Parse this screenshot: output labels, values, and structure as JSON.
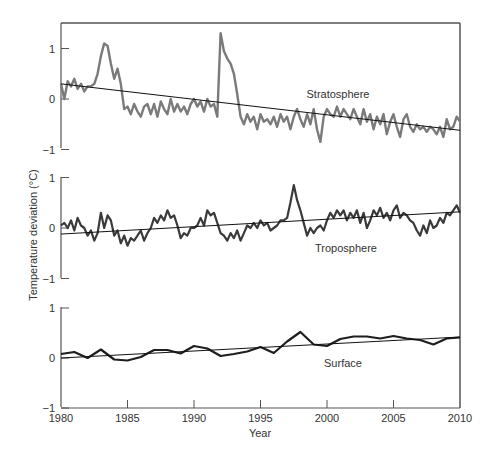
{
  "chart_data": {
    "type": "line",
    "title": "",
    "xlabel": "Year",
    "ylabel": "Temperature deviation (°C)",
    "x_range": [
      1980,
      2010
    ],
    "x_ticks": [
      1980,
      1985,
      1990,
      1995,
      2000,
      2005,
      2010
    ],
    "grid": false,
    "legend": "none (panels labeled inline)",
    "panels": [
      {
        "name": "Stratosphere",
        "label": "Stratosphere",
        "ylim": [
          -1,
          1
        ],
        "y_ticks": [
          -1,
          0,
          1
        ],
        "line_color": "#7a7a7a",
        "trend": {
          "start": [
            1980,
            0.3
          ],
          "end": [
            2010,
            -0.62
          ]
        },
        "x": [
          1980.0,
          1980.25,
          1980.5,
          1980.75,
          1981.0,
          1981.25,
          1981.5,
          1981.75,
          1982.0,
          1982.25,
          1982.5,
          1982.75,
          1983.0,
          1983.25,
          1983.5,
          1983.75,
          1984.0,
          1984.25,
          1984.5,
          1984.75,
          1985.0,
          1985.25,
          1985.5,
          1985.75,
          1986.0,
          1986.25,
          1986.5,
          1986.75,
          1987.0,
          1987.25,
          1987.5,
          1987.75,
          1988.0,
          1988.25,
          1988.5,
          1988.75,
          1989.0,
          1989.25,
          1989.5,
          1989.75,
          1990.0,
          1990.25,
          1990.5,
          1990.75,
          1991.0,
          1991.25,
          1991.5,
          1991.75,
          1992.0,
          1992.25,
          1992.5,
          1992.75,
          1993.0,
          1993.25,
          1993.5,
          1993.75,
          1994.0,
          1994.25,
          1994.5,
          1994.75,
          1995.0,
          1995.25,
          1995.5,
          1995.75,
          1996.0,
          1996.25,
          1996.5,
          1996.75,
          1997.0,
          1997.25,
          1997.5,
          1997.75,
          1998.0,
          1998.25,
          1998.5,
          1998.75,
          1999.0,
          1999.25,
          1999.5,
          1999.75,
          2000.0,
          2000.25,
          2000.5,
          2000.75,
          2001.0,
          2001.25,
          2001.5,
          2001.75,
          2002.0,
          2002.25,
          2002.5,
          2002.75,
          2003.0,
          2003.25,
          2003.5,
          2003.75,
          2004.0,
          2004.25,
          2004.5,
          2004.75,
          2005.0,
          2005.25,
          2005.5,
          2005.75,
          2006.0,
          2006.25,
          2006.5,
          2006.75,
          2007.0,
          2007.25,
          2007.5,
          2007.75,
          2008.0,
          2008.25,
          2008.5,
          2008.75,
          2009.0,
          2009.25,
          2009.5,
          2009.75,
          2010.0
        ],
        "values": [
          0.3,
          0.0,
          0.35,
          0.25,
          0.4,
          0.2,
          0.3,
          0.15,
          0.25,
          0.25,
          0.3,
          0.5,
          0.85,
          1.1,
          1.05,
          0.7,
          0.4,
          0.6,
          0.3,
          -0.2,
          -0.15,
          -0.3,
          -0.1,
          -0.25,
          -0.35,
          -0.15,
          -0.1,
          -0.3,
          -0.1,
          -0.35,
          -0.05,
          -0.2,
          -0.3,
          0.0,
          -0.25,
          -0.1,
          -0.25,
          -0.15,
          -0.3,
          -0.1,
          0.0,
          -0.15,
          -0.05,
          -0.25,
          0.0,
          -0.15,
          -0.1,
          -0.35,
          1.3,
          0.95,
          0.8,
          0.7,
          0.5,
          0.1,
          -0.35,
          -0.5,
          -0.3,
          -0.45,
          -0.35,
          -0.6,
          -0.3,
          -0.45,
          -0.4,
          -0.5,
          -0.35,
          -0.55,
          -0.3,
          -0.45,
          -0.35,
          -0.6,
          -0.35,
          -0.2,
          -0.4,
          -0.55,
          -0.3,
          -0.5,
          -0.2,
          -0.6,
          -0.85,
          -0.35,
          -0.2,
          -0.3,
          -0.35,
          -0.15,
          -0.35,
          -0.2,
          -0.3,
          -0.4,
          -0.2,
          -0.35,
          -0.5,
          -0.2,
          -0.45,
          -0.3,
          -0.6,
          -0.35,
          -0.5,
          -0.3,
          -0.7,
          -0.45,
          -0.3,
          -0.55,
          -0.75,
          -0.4,
          -0.3,
          -0.55,
          -0.65,
          -0.5,
          -0.6,
          -0.55,
          -0.65,
          -0.55,
          -0.6,
          -0.7,
          -0.55,
          -0.75,
          -0.4,
          -0.6,
          -0.55,
          -0.35,
          -0.45
        ]
      },
      {
        "name": "Troposphere",
        "label": "Troposphere",
        "ylim": [
          -1,
          1
        ],
        "y_ticks": [
          -1,
          0,
          1
        ],
        "line_color": "#3a3a3a",
        "trend": {
          "start": [
            1980,
            -0.12
          ],
          "end": [
            2010,
            0.32
          ]
        },
        "x": [
          1980.0,
          1980.25,
          1980.5,
          1980.75,
          1981.0,
          1981.25,
          1981.5,
          1981.75,
          1982.0,
          1982.25,
          1982.5,
          1982.75,
          1983.0,
          1983.25,
          1983.5,
          1983.75,
          1984.0,
          1984.25,
          1984.5,
          1984.75,
          1985.0,
          1985.25,
          1985.5,
          1985.75,
          1986.0,
          1986.25,
          1986.5,
          1986.75,
          1987.0,
          1987.25,
          1987.5,
          1987.75,
          1988.0,
          1988.25,
          1988.5,
          1988.75,
          1989.0,
          1989.25,
          1989.5,
          1989.75,
          1990.0,
          1990.25,
          1990.5,
          1990.75,
          1991.0,
          1991.25,
          1991.5,
          1991.75,
          1992.0,
          1992.25,
          1992.5,
          1992.75,
          1993.0,
          1993.25,
          1993.5,
          1993.75,
          1994.0,
          1994.25,
          1994.5,
          1994.75,
          1995.0,
          1995.25,
          1995.5,
          1995.75,
          1996.0,
          1996.25,
          1996.5,
          1996.75,
          1997.0,
          1997.25,
          1997.5,
          1997.75,
          1998.0,
          1998.25,
          1998.5,
          1998.75,
          1999.0,
          1999.25,
          1999.5,
          1999.75,
          2000.0,
          2000.25,
          2000.5,
          2000.75,
          2001.0,
          2001.25,
          2001.5,
          2001.75,
          2002.0,
          2002.25,
          2002.5,
          2002.75,
          2003.0,
          2003.25,
          2003.5,
          2003.75,
          2004.0,
          2004.25,
          2004.5,
          2004.75,
          2005.0,
          2005.25,
          2005.5,
          2005.75,
          2006.0,
          2006.25,
          2006.5,
          2006.75,
          2007.0,
          2007.25,
          2007.5,
          2007.75,
          2008.0,
          2008.25,
          2008.5,
          2008.75,
          2009.0,
          2009.25,
          2009.5,
          2009.75,
          2010.0
        ],
        "values": [
          0.05,
          0.1,
          0.0,
          0.15,
          -0.05,
          0.2,
          0.05,
          0.0,
          -0.15,
          -0.05,
          -0.25,
          -0.1,
          0.3,
          0.0,
          0.25,
          0.15,
          -0.15,
          -0.05,
          -0.3,
          -0.15,
          -0.35,
          -0.2,
          -0.25,
          -0.15,
          -0.05,
          -0.25,
          -0.1,
          0.0,
          0.2,
          0.1,
          0.25,
          0.15,
          0.35,
          0.2,
          0.25,
          0.05,
          -0.2,
          -0.1,
          -0.15,
          0.0,
          0.0,
          0.05,
          0.2,
          0.05,
          0.35,
          0.25,
          0.3,
          0.1,
          -0.1,
          -0.15,
          -0.25,
          -0.1,
          -0.2,
          -0.05,
          -0.25,
          -0.1,
          0.05,
          0.0,
          0.1,
          0.0,
          0.15,
          0.05,
          0.1,
          -0.05,
          0.0,
          0.05,
          0.15,
          0.15,
          0.2,
          0.5,
          0.85,
          0.55,
          0.35,
          0.1,
          -0.15,
          0.0,
          -0.1,
          0.0,
          0.05,
          -0.05,
          0.15,
          0.3,
          0.2,
          0.35,
          0.25,
          0.35,
          0.15,
          0.3,
          0.2,
          0.35,
          0.1,
          0.3,
          0.0,
          0.15,
          0.35,
          0.25,
          0.4,
          0.2,
          0.3,
          0.15,
          0.35,
          0.45,
          0.2,
          0.3,
          0.25,
          0.15,
          0.1,
          -0.05,
          -0.15,
          0.05,
          -0.1,
          0.15,
          0.0,
          0.05,
          0.2,
          0.1,
          0.3,
          0.25,
          0.35,
          0.45,
          0.3
        ]
      },
      {
        "name": "Surface",
        "label": "Surface",
        "ylim": [
          -1,
          1
        ],
        "y_ticks": [
          -1,
          0,
          1
        ],
        "line_color": "#1e1e1e",
        "trend": {
          "start": [
            1980,
            0.0
          ],
          "end": [
            2010,
            0.42
          ]
        },
        "x": [
          1980,
          1981,
          1982,
          1983,
          1984,
          1985,
          1986,
          1987,
          1988,
          1989,
          1990,
          1991,
          1992,
          1993,
          1994,
          1995,
          1996,
          1997,
          1998,
          1999,
          2000,
          2001,
          2002,
          2003,
          2004,
          2005,
          2006,
          2007,
          2008,
          2009,
          2010
        ],
        "values": [
          0.08,
          0.12,
          0.0,
          0.17,
          -0.03,
          -0.05,
          0.02,
          0.16,
          0.16,
          0.09,
          0.24,
          0.19,
          0.04,
          0.08,
          0.13,
          0.22,
          0.1,
          0.33,
          0.52,
          0.27,
          0.24,
          0.38,
          0.43,
          0.43,
          0.39,
          0.44,
          0.39,
          0.36,
          0.27,
          0.39,
          0.41
        ]
      }
    ]
  }
}
